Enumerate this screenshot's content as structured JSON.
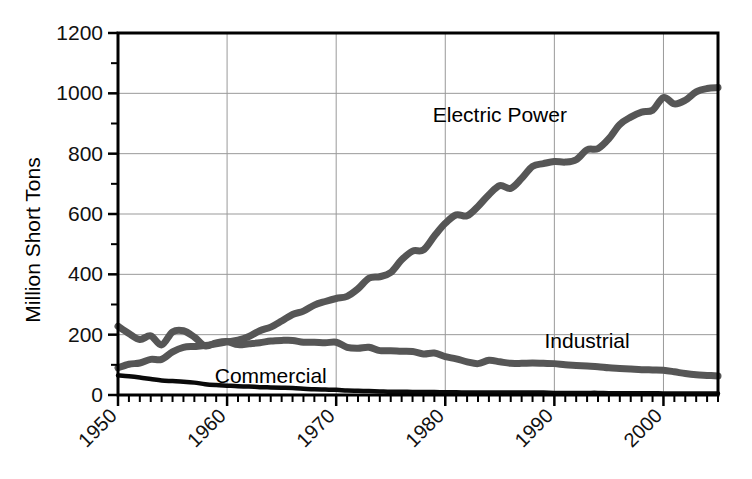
{
  "chart_data": {
    "type": "line",
    "title": "",
    "xlabel": "",
    "ylabel": "Million Short Tons",
    "xlim": [
      1950,
      2005
    ],
    "ylim": [
      0,
      1200
    ],
    "yticks": [
      0,
      200,
      400,
      600,
      800,
      1000,
      1200
    ],
    "ytick_labels": [
      "0",
      "200",
      "400",
      "600",
      "800",
      "1000",
      "1200"
    ],
    "xticks": [
      1950,
      1960,
      1970,
      1980,
      1990,
      2000
    ],
    "xtick_labels": [
      "1950",
      "1960",
      "1970",
      "1980",
      "1990",
      "2000"
    ],
    "minor_xtick_step": 1,
    "minor_ytick_step": 100,
    "grid": "both-major",
    "legend": "inline-annotations",
    "x": [
      1950,
      1951,
      1952,
      1953,
      1954,
      1955,
      1956,
      1957,
      1958,
      1959,
      1960,
      1961,
      1962,
      1963,
      1964,
      1965,
      1966,
      1967,
      1968,
      1969,
      1970,
      1971,
      1972,
      1973,
      1974,
      1975,
      1976,
      1977,
      1978,
      1979,
      1980,
      1981,
      1982,
      1983,
      1984,
      1985,
      1986,
      1987,
      1988,
      1989,
      1990,
      1991,
      1992,
      1993,
      1994,
      1995,
      1996,
      1997,
      1998,
      1999,
      2000,
      2001,
      2002,
      2003,
      2004,
      2005
    ],
    "series": [
      {
        "name": "Electric Power",
        "color": "#565656",
        "label_x": 1985,
        "label_y": 905,
        "values": [
          90,
          102,
          106,
          118,
          118,
          143,
          158,
          161,
          164,
          170,
          176,
          182,
          194,
          213,
          225,
          245,
          267,
          278,
          298,
          310,
          320,
          327,
          352,
          387,
          392,
          406,
          448,
          477,
          481,
          527,
          569,
          597,
          594,
          625,
          664,
          694,
          685,
          718,
          758,
          767,
          774,
          772,
          780,
          813,
          817,
          850,
          897,
          921,
          938,
          944,
          986,
          965,
          977,
          1005,
          1016,
          1019
        ]
      },
      {
        "name": "Industrial",
        "color": "#565656",
        "label_x": 1993,
        "label_y": 155,
        "values": [
          228,
          204,
          184,
          196,
          166,
          209,
          213,
          192,
          163,
          173,
          177,
          167,
          170,
          173,
          179,
          181,
          181,
          175,
          175,
          173,
          175,
          158,
          155,
          158,
          147,
          147,
          145,
          144,
          136,
          139,
          127,
          120,
          110,
          104,
          115,
          110,
          105,
          105,
          106,
          105,
          104,
          100,
          98,
          96,
          94,
          90,
          88,
          86,
          84,
          83,
          82,
          77,
          71,
          67,
          65,
          63
        ]
      },
      {
        "name": "Commercial",
        "color": "#0a0a0a",
        "label_x": 1964,
        "label_y": 40,
        "values": [
          65,
          62,
          58,
          53,
          48,
          46,
          44,
          41,
          36,
          33,
          31,
          29,
          28,
          26,
          25,
          24,
          23,
          21,
          19,
          18,
          17,
          15,
          14,
          13,
          12,
          11,
          11,
          10,
          10,
          10,
          9,
          9,
          8,
          8,
          8,
          8,
          8,
          8,
          8,
          8,
          7,
          7,
          7,
          7,
          7,
          6,
          6,
          6,
          6,
          6,
          5,
          5,
          5,
          5,
          5,
          5
        ]
      }
    ]
  },
  "axis": {
    "ylabel_text": "Million Short Tons",
    "frame_color": "#000000",
    "grid_color": "#999999"
  },
  "annotations": [
    {
      "text": "Electric Power"
    },
    {
      "text": "Industrial"
    },
    {
      "text": "Commercial"
    }
  ]
}
